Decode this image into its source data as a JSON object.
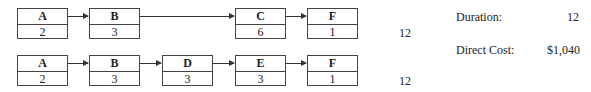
{
  "paths": [
    {
      "activities": [
        {
          "name": "A",
          "duration": "2"
        },
        {
          "name": "B",
          "duration": "3"
        },
        {
          "name": "C",
          "duration": "6"
        },
        {
          "name": "F",
          "duration": "1"
        }
      ],
      "total": "12"
    },
    {
      "activities": [
        {
          "name": "A",
          "duration": "2"
        },
        {
          "name": "B",
          "duration": "3"
        },
        {
          "name": "D",
          "duration": "3"
        },
        {
          "name": "E",
          "duration": "3"
        },
        {
          "name": "F",
          "duration": "1"
        }
      ],
      "total": "12"
    }
  ],
  "summary": {
    "duration_label": "Duration:",
    "duration_value": "12",
    "cost_label": "Direct Cost:",
    "cost_value": "$1,040"
  }
}
